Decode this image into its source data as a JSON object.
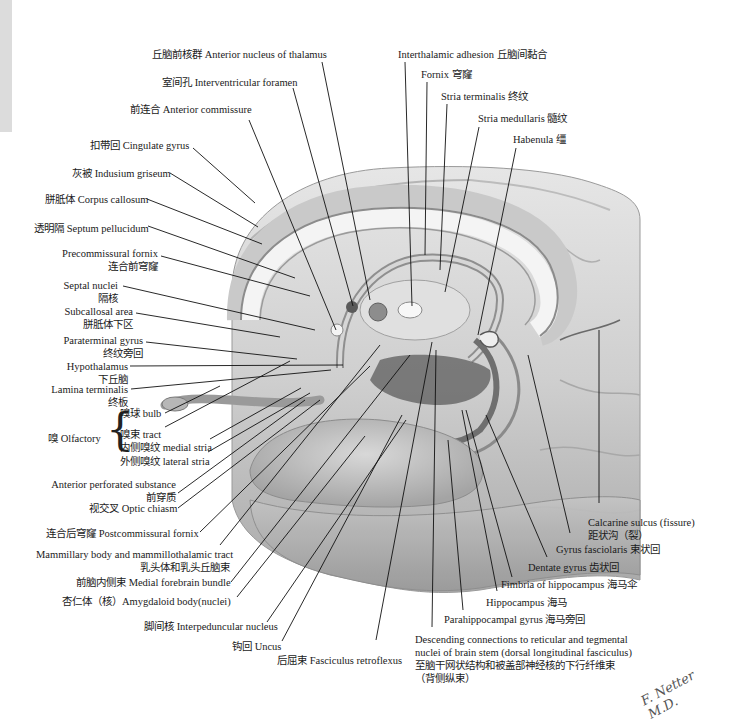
{
  "figure": {
    "type": "anatomical-illustration",
    "signature": "F. Netter M.D."
  },
  "labels": {
    "top": [
      {
        "id": "anterior-nucleus-thalamus",
        "text": "丘脑前核群 Anterior nucleus of thalamus"
      },
      {
        "id": "interventricular-foramen",
        "text": "室间孔 Interventricular foramen"
      },
      {
        "id": "anterior-commissure",
        "text": "前连合 Anterior commissure"
      },
      {
        "id": "interthalamic-adhesion",
        "text": "Interthalamic adhesion 丘脑间黏合"
      },
      {
        "id": "fornix",
        "text": "Fornix 穹窿"
      },
      {
        "id": "stria-terminalis",
        "text": "Stria terminalis 终纹"
      },
      {
        "id": "stria-medullaris",
        "text": "Stria medullaris 髓纹"
      },
      {
        "id": "habenula",
        "text": "Habenula 缰"
      }
    ],
    "left": [
      {
        "id": "cingulate-gyrus",
        "text": "扣带回 Cingulate gyrus"
      },
      {
        "id": "indusium-griseum",
        "text": "灰被 Indusium griseum"
      },
      {
        "id": "corpus-callosum",
        "text": "胼胝体 Corpus callosum"
      },
      {
        "id": "septum-pellucidum",
        "text": "透明隔 Septum pellucidum"
      },
      {
        "id": "precommissural-fornix",
        "text": "Precommissural fornix",
        "sub": "连合前穹窿"
      },
      {
        "id": "septal-nuclei",
        "text": "Septal nuclei",
        "sub": "隔核"
      },
      {
        "id": "subcallosal-area",
        "text": "Subcallosal area",
        "sub": "胼胝体下区"
      },
      {
        "id": "paraterminal-gyrus",
        "text": "Paraterminal gyrus",
        "sub": "终纹旁回"
      },
      {
        "id": "hypothalamus",
        "text": "Hypothalamus",
        "sub": "下丘脑"
      },
      {
        "id": "lamina-terminalis",
        "text": "Lamina terminalis",
        "sub": "终板"
      }
    ],
    "olfactory": {
      "group": "嗅 Olfactory",
      "items": [
        {
          "id": "olfactory-bulb",
          "text": "嗅球 bulb"
        },
        {
          "id": "olfactory-tract",
          "text": "嗅束 tract"
        },
        {
          "id": "medial-stria",
          "text": "内侧嗅纹 medial stria"
        },
        {
          "id": "lateral-stria",
          "text": "外侧嗅纹 lateral stria"
        }
      ]
    },
    "bottom_left": [
      {
        "id": "anterior-perforated-substance",
        "text": "Anterior perforated substance",
        "sub": "前穿质"
      },
      {
        "id": "optic-chiasm",
        "text": "视交叉 Optic chiasm"
      },
      {
        "id": "postcommissural-fornix",
        "text": "连合后穹窿 Postcommissural fornix"
      },
      {
        "id": "mammillary-body",
        "text": "Mammillary body and mammillothalamic tract",
        "sub": "乳头体和乳头丘脑束"
      },
      {
        "id": "medial-forebrain-bundle",
        "text": "前脑内侧束 Medial forebrain bundle"
      },
      {
        "id": "amygdaloid-body",
        "text": "杏仁体（核）Amygdaloid body(nuclei)"
      },
      {
        "id": "interpeduncular-nucleus",
        "text": "脚间核 Interpeduncular nucleus"
      },
      {
        "id": "uncus",
        "text": "钩回 Uncus"
      },
      {
        "id": "fasciculus-retroflexus",
        "text": "后屈束 Fasciculus retroflexus"
      }
    ],
    "bottom_right": [
      {
        "id": "calcarine-sulcus",
        "text": "Calcarine sulcus (fissure)",
        "sub": "距状沟（裂）"
      },
      {
        "id": "gyrus-fasciolaris",
        "text": "Gyrus fasciolaris 束状回"
      },
      {
        "id": "dentate-gyrus",
        "text": "Dentate gyrus 齿状回"
      },
      {
        "id": "fimbria-hippocampus",
        "text": "Fimbria of hippocampus 海马伞"
      },
      {
        "id": "hippocampus",
        "text": "Hippocampus 海马"
      },
      {
        "id": "parahippocampal-gyrus",
        "text": "Parahippocampal gyrus 海马旁回"
      },
      {
        "id": "descending-connections",
        "text": "Descending connections to reticular and tegmental",
        "line2": "nuclei of brain stem (dorsal longitudinal fasciculus)",
        "line3": "至脑干网状结构和被盖部神经核的下行纤维束",
        "line4": "（背侧纵束）"
      }
    ]
  }
}
